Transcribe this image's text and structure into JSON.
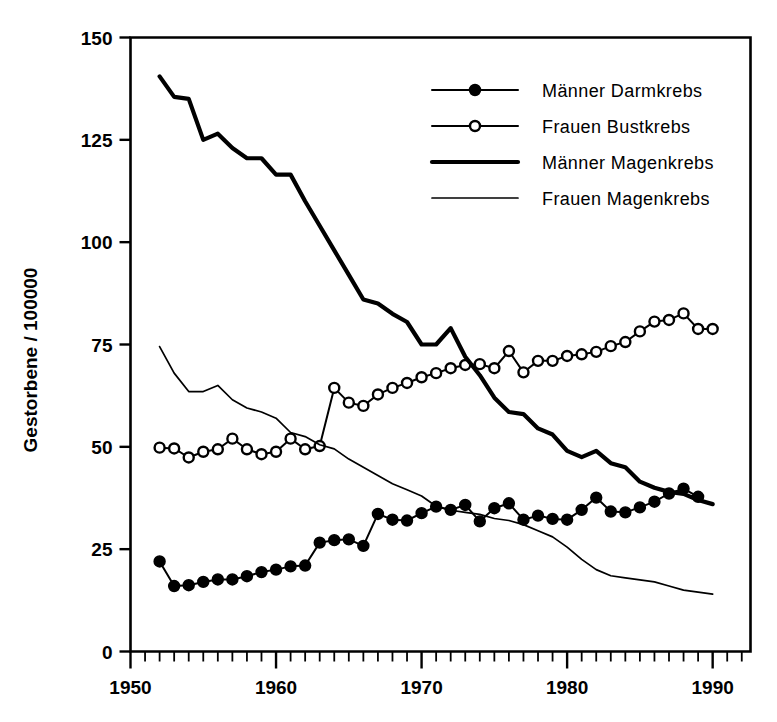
{
  "chart_data": {
    "type": "line",
    "title": "",
    "subtitle": "",
    "xlabel": "",
    "ylabel": "Gestorbene / 100000",
    "xlim": [
      1950,
      1992.6
    ],
    "ylim": [
      0,
      150
    ],
    "grid": false,
    "legend_position": "top-right",
    "x_ticks_major": [
      1950,
      1960,
      1970,
      1980,
      1990
    ],
    "x_tick_labels": [
      "1950",
      "1960",
      "1970",
      "1980",
      "1990"
    ],
    "x_tick_minor_step": 1,
    "y_ticks": [
      0,
      25,
      50,
      75,
      100,
      125,
      150
    ],
    "y_tick_labels": [
      "0",
      "25",
      "50",
      "75",
      "100",
      "125",
      "150"
    ],
    "series": [
      {
        "name": "Männer Darmkrebs",
        "style": "line-marker-filled",
        "marker": "filled-circle",
        "x": [
          1952,
          1953,
          1954,
          1955,
          1956,
          1957,
          1958,
          1959,
          1960,
          1961,
          1962,
          1963,
          1964,
          1965,
          1966,
          1967,
          1968,
          1969,
          1970,
          1971,
          1972,
          1973,
          1974,
          1975,
          1976,
          1977,
          1978,
          1979,
          1980,
          1981,
          1982,
          1983,
          1984,
          1985,
          1986,
          1987,
          1988,
          1989
        ],
        "values": [
          22.0,
          16.0,
          16.2,
          17.0,
          17.6,
          17.6,
          18.4,
          19.4,
          20.0,
          20.8,
          21.0,
          26.6,
          27.2,
          27.4,
          25.8,
          33.6,
          32.2,
          32.0,
          33.8,
          35.4,
          34.6,
          35.8,
          31.8,
          35.0,
          36.2,
          32.2,
          33.2,
          32.4,
          32.2,
          34.6,
          37.6,
          34.2,
          34.0,
          35.2,
          36.6,
          38.6,
          39.8,
          37.8
        ]
      },
      {
        "name": "Frauen Bustkrebs",
        "style": "line-marker-open",
        "marker": "open-circle",
        "x": [
          1952,
          1953,
          1954,
          1955,
          1956,
          1957,
          1958,
          1959,
          1960,
          1961,
          1962,
          1963,
          1964,
          1965,
          1966,
          1967,
          1968,
          1969,
          1970,
          1971,
          1972,
          1973,
          1974,
          1975,
          1976,
          1977,
          1978,
          1979,
          1980,
          1981,
          1982,
          1983,
          1984,
          1985,
          1986,
          1987,
          1988,
          1989,
          1990
        ],
        "values": [
          49.8,
          49.6,
          47.4,
          48.8,
          49.4,
          52.0,
          49.4,
          48.2,
          48.8,
          52.0,
          49.4,
          50.2,
          64.4,
          60.8,
          60.0,
          62.8,
          64.4,
          65.6,
          67.0,
          68.0,
          69.2,
          70.0,
          70.2,
          69.2,
          73.4,
          68.2,
          71.0,
          71.0,
          72.2,
          72.6,
          73.2,
          74.6,
          75.6,
          78.2,
          80.6,
          81.0,
          82.6,
          78.8,
          78.8
        ]
      },
      {
        "name": "Männer Magenkrebs",
        "style": "line-thick",
        "marker": "none",
        "x": [
          1952,
          1953,
          1954,
          1955,
          1956,
          1957,
          1958,
          1959,
          1960,
          1961,
          1962,
          1963,
          1964,
          1965,
          1966,
          1967,
          1968,
          1969,
          1970,
          1971,
          1972,
          1973,
          1974,
          1975,
          1976,
          1977,
          1978,
          1979,
          1980,
          1981,
          1982,
          1983,
          1984,
          1985,
          1986,
          1987,
          1988,
          1989,
          1990
        ],
        "values": [
          140.5,
          135.5,
          135.0,
          125.0,
          126.5,
          123.0,
          120.5,
          120.5,
          116.5,
          116.5,
          110.0,
          104.0,
          98.0,
          92.0,
          86.0,
          85.0,
          82.5,
          80.5,
          75.0,
          75.0,
          79.0,
          72.0,
          67.5,
          62.0,
          58.5,
          58.0,
          54.5,
          53.0,
          49.0,
          47.5,
          49.0,
          46.0,
          45.0,
          41.5,
          40.0,
          39.0,
          38.5,
          37.0,
          36.0
        ]
      },
      {
        "name": "Frauen Magenkrebs",
        "style": "line-thin",
        "marker": "none",
        "x": [
          1952,
          1953,
          1954,
          1955,
          1956,
          1957,
          1958,
          1959,
          1960,
          1961,
          1962,
          1963,
          1964,
          1965,
          1966,
          1967,
          1968,
          1969,
          1970,
          1971,
          1972,
          1973,
          1974,
          1975,
          1976,
          1977,
          1978,
          1979,
          1980,
          1981,
          1982,
          1983,
          1984,
          1985,
          1986,
          1987,
          1988,
          1989,
          1990
        ],
        "values": [
          74.5,
          68.0,
          63.5,
          63.5,
          65.0,
          61.5,
          59.5,
          58.5,
          57.0,
          53.5,
          52.5,
          50.5,
          49.5,
          47.0,
          45.0,
          43.0,
          41.0,
          39.5,
          38.0,
          35.5,
          34.5,
          34.0,
          33.5,
          32.5,
          32.0,
          31.0,
          29.5,
          28.0,
          25.5,
          22.5,
          20.0,
          18.5,
          18.0,
          17.5,
          17.0,
          16.0,
          15.0,
          14.5,
          14.0
        ]
      }
    ],
    "legend_entries": [
      {
        "label": "Männer Darmkrebs",
        "marker": "filled-circle",
        "style": "line-marker-filled"
      },
      {
        "label": "Frauen Bustkrebs",
        "marker": "open-circle",
        "style": "line-marker-open"
      },
      {
        "label": "Männer Magenkrebs",
        "marker": "none",
        "style": "line-thick"
      },
      {
        "label": "Frauen Magenkrebs",
        "marker": "none",
        "style": "line-thin"
      }
    ]
  }
}
